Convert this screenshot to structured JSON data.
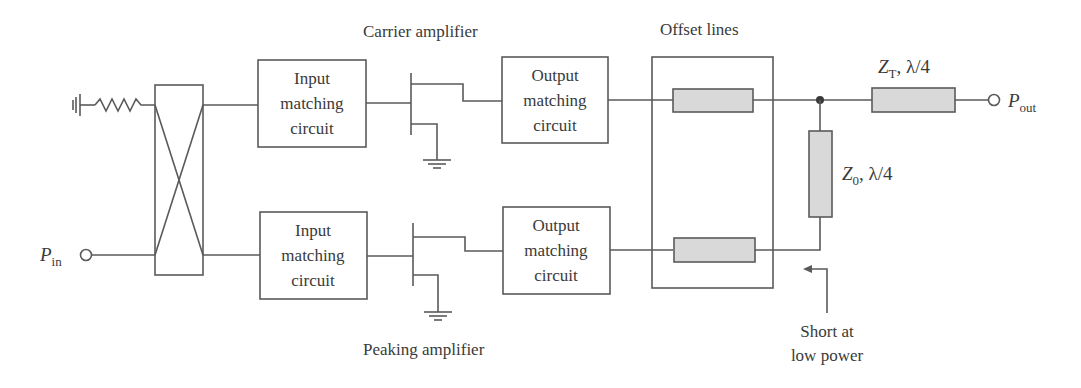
{
  "diagram": {
    "type": "Doherty amplifier block diagram",
    "labels": {
      "carrier_amplifier": "Carrier amplifier",
      "peaking_amplifier": "Peaking amplifier",
      "offset_lines": "Offset lines",
      "short_line1": "Short at",
      "short_line2": "low power"
    },
    "ports": {
      "input": {
        "symbol": "P",
        "subscript": "in"
      },
      "output": {
        "symbol": "P",
        "subscript": "out"
      }
    },
    "blocks": {
      "input_match_top": [
        "Input",
        "matching",
        "circuit"
      ],
      "input_match_bottom": [
        "Input",
        "matching",
        "circuit"
      ],
      "output_match_top": [
        "Output",
        "matching",
        "circuit"
      ],
      "output_match_bottom": [
        "Output",
        "matching",
        "circuit"
      ]
    },
    "transmission_lines": {
      "zt": {
        "symbol": "Z",
        "subscript": "T",
        "suffix": ", λ/4"
      },
      "z0": {
        "symbol": "Z",
        "subscript": "0",
        "suffix": ", λ/4"
      }
    },
    "components": {
      "coupler": "hybrid-coupler",
      "termination": "resistor-to-ground",
      "carrier_device": "transistor",
      "peaking_device": "transistor"
    },
    "colors": {
      "line": "#5a5a5a",
      "tline_fill": "#d9d9d9",
      "text": "#3a3a3a"
    }
  }
}
